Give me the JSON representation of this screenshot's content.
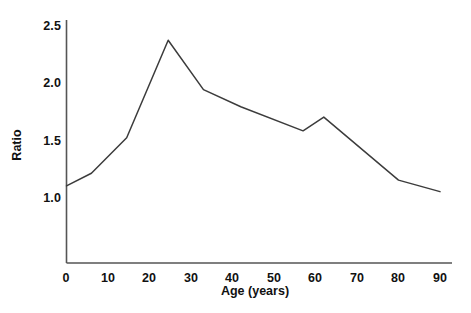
{
  "chart_data": {
    "type": "line",
    "title": "",
    "subtitle": "",
    "xlabel": "Age (years)",
    "ylabel": "Ratio",
    "xlim": [
      0,
      90
    ],
    "ylim": [
      0.85,
      2.5
    ],
    "grid": false,
    "legend": null,
    "line_color": "#3c3c3c",
    "axis_color": "#555555",
    "background": "#ffffff",
    "xticks": [
      0,
      10,
      20,
      30,
      40,
      50,
      60,
      70,
      80,
      90
    ],
    "xtick_labels": [
      "0",
      "10",
      "20",
      "30",
      "40",
      "50",
      "60",
      "70",
      "80",
      "90"
    ],
    "yticks": [
      1.0,
      1.5,
      2.0,
      2.5
    ],
    "ytick_labels": [
      "1.0",
      "1.5",
      "2.0",
      "2.5"
    ],
    "x": [
      0,
      6,
      14.5,
      24.5,
      33,
      42,
      57,
      62,
      80,
      90
    ],
    "values": [
      1.11,
      1.22,
      1.53,
      2.38,
      1.95,
      1.8,
      1.59,
      1.71,
      1.16,
      1.06
    ],
    "series": [
      {
        "name": "Ratio",
        "x": [
          0,
          6,
          14.5,
          24.5,
          33,
          42,
          57,
          62,
          80,
          90
        ],
        "values": [
          1.11,
          1.22,
          1.53,
          2.38,
          1.95,
          1.8,
          1.59,
          1.71,
          1.16,
          1.06
        ]
      }
    ],
    "annotations": []
  }
}
